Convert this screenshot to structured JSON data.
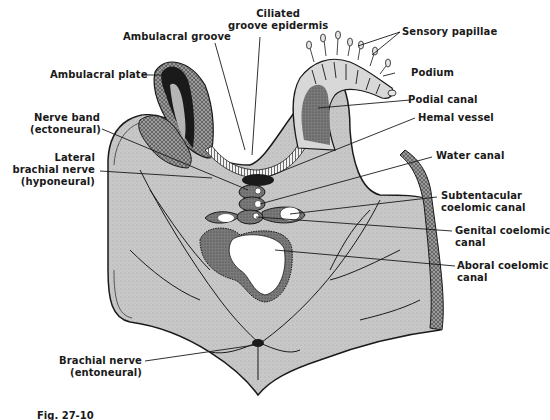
{
  "figure": {
    "caption": "Fig. 27-10",
    "colors": {
      "tissue_fill": "#c9c9c9",
      "dark_tissue": "#6f6f6f",
      "outline": "#1a1a1a",
      "lumen": "#ffffff",
      "background": "#ffffff"
    },
    "labels": {
      "ciliated_groove_epidermis": {
        "line1": "Ciliated",
        "line2": "groove epidermis"
      },
      "ambulacral_groove": {
        "line1": "Ambulacral groove"
      },
      "sensory_papillae": {
        "line1": "Sensory papillae"
      },
      "ambulacral_plate": {
        "line1": "Ambulacral plate"
      },
      "podium": {
        "line1": "Podium"
      },
      "podial_canal": {
        "line1": "Podial canal"
      },
      "nerve_band": {
        "line1": "Nerve band",
        "line2": "(ectoneural)"
      },
      "hemal_vessel": {
        "line1": "Hemal vessel"
      },
      "lateral_brachial_nerve": {
        "line1": "Lateral",
        "line2": "brachial  nerve",
        "line3": "(hyponeural)"
      },
      "water_canal": {
        "line1": "Water canal"
      },
      "subtentacular_coelomic_canal": {
        "line1": "Subtentacular",
        "line2": "coelomic canal"
      },
      "genital_coelomic_canal": {
        "line1": "Genital coelomic",
        "line2": "canal"
      },
      "aboral_coelomic_canal": {
        "line1": "Aboral coelomic",
        "line2": "canal"
      },
      "brachial_nerve": {
        "line1": "Brachial nerve",
        "line2": "(entoneural)"
      }
    }
  }
}
